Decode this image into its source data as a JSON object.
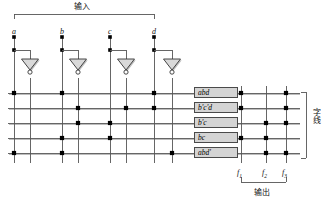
{
  "diagram": {
    "title_top": "输入",
    "title_bottom": "输出",
    "title_right": "字线",
    "input_labels": [
      "a",
      "b",
      "c",
      "d"
    ],
    "output_labels": [
      "f1",
      "f2",
      "f3"
    ],
    "output_label_text": [
      "f",
      "f",
      "f"
    ],
    "output_label_sub": [
      "1",
      "2",
      "3"
    ],
    "product_terms": [
      {
        "name": "abd",
        "and_inputs": [
          "a",
          "b",
          "d"
        ],
        "or_outputs": [
          "f1",
          "f3"
        ]
      },
      {
        "name": "b'c'd",
        "and_inputs": [
          "b'",
          "c'",
          "d"
        ],
        "or_outputs": [
          "f1",
          "f3"
        ]
      },
      {
        "name": "b'c",
        "and_inputs": [
          "b'",
          "c"
        ],
        "or_outputs": [
          "f2",
          "f3"
        ]
      },
      {
        "name": "bc",
        "and_inputs": [
          "b",
          "c"
        ],
        "or_outputs": [
          "f1",
          "f2"
        ]
      },
      {
        "name": "abd'",
        "and_inputs": [
          "a",
          "b",
          "d'"
        ],
        "or_outputs": [
          "f2",
          "f3"
        ]
      }
    ],
    "column_order": [
      "a",
      "a'",
      "b",
      "b'",
      "c",
      "c'",
      "d",
      "d'"
    ],
    "colors": {
      "line": "#555555",
      "dot": "#000000",
      "box_fill": "#d4d4d4",
      "box_stroke": "#4a4a4a",
      "gate_fill": "#d9d9d9",
      "shadow": "#bdbdbd"
    },
    "gate_count": 4,
    "gate_type": "inverter"
  }
}
